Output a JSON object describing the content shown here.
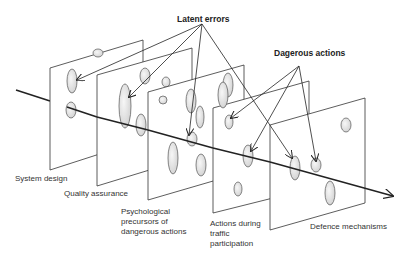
{
  "title_labels": {
    "latent_errors": "Latent errors",
    "dangerous_actions": "Dagerous actions"
  },
  "layers": [
    {
      "id": "system-design",
      "label": "System design"
    },
    {
      "id": "quality-assurance",
      "label": "Quality assurance"
    },
    {
      "id": "psychological-precursors",
      "label": "Psychological\nprecursors of\ndangerous actions"
    },
    {
      "id": "actions-during-traffic",
      "label": "Actions during\ntraffic\nparticipation"
    },
    {
      "id": "defence-mechanisms",
      "label": "Defence mechanisms"
    }
  ],
  "colors": {
    "line": "#222222",
    "hole_fill": "#e6e6e6",
    "hole_stroke": "#555555",
    "text": "#333333"
  }
}
